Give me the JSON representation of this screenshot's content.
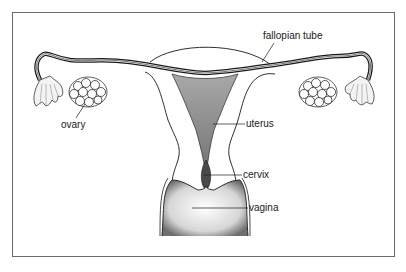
{
  "diagram": {
    "labels": {
      "fallopian_tube": "fallopian tube",
      "ovary": "ovary",
      "uterus": "uterus",
      "cervix": "cervix",
      "vagina": "vagina"
    }
  },
  "colors": {
    "line": "#1a1a1a",
    "shade": "#8a8a8a",
    "frame": "#6a6a6a",
    "background": "#ffffff"
  }
}
